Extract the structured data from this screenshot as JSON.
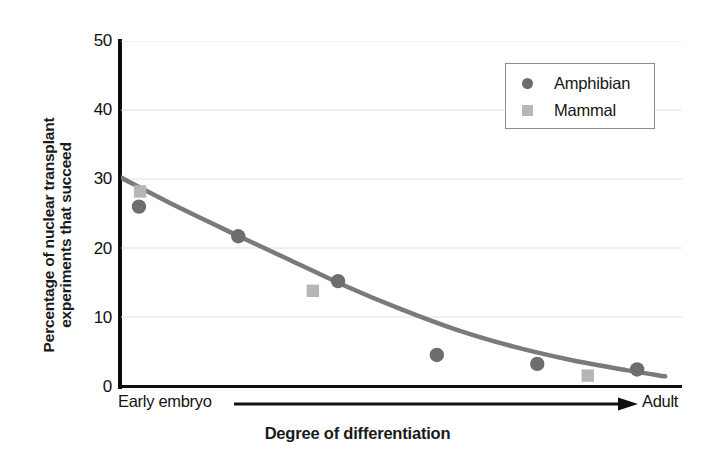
{
  "chart_data": {
    "type": "scatter",
    "title": "",
    "xlabel": "Degree of differentiation",
    "ylabel": "Percentage of nuclear transplant experiments that succeed",
    "ylabel_lines": [
      "Percentage of nuclear transplant",
      "experiments that succeed"
    ],
    "ylim": [
      0,
      50
    ],
    "yticks": [
      0,
      10,
      20,
      30,
      40,
      50
    ],
    "ytick_labels": [
      "0",
      "10",
      "20",
      "30",
      "40",
      "50"
    ],
    "xlim": [
      0,
      100
    ],
    "xticks": [],
    "xtick_labels": [],
    "x_axis_start_label": "Early embryo",
    "x_axis_end_label": "Adult",
    "x_axis_arrow": true,
    "grid": true,
    "grid_axis": "y",
    "grid_color": "#e2e2e2",
    "legend_position": "upper right",
    "series": [
      {
        "name": "Amphibian",
        "marker": "circle",
        "color": "#6d6d6d",
        "points": [
          {
            "x": 3.2,
            "y": 26.0
          },
          {
            "x": 20.9,
            "y": 21.7
          },
          {
            "x": 38.7,
            "y": 15.2
          },
          {
            "x": 56.3,
            "y": 4.5
          },
          {
            "x": 74.2,
            "y": 3.2
          },
          {
            "x": 92.0,
            "y": 2.4
          }
        ]
      },
      {
        "name": "Mammal",
        "marker": "square",
        "color": "#b6b6b6",
        "points": [
          {
            "x": 3.4,
            "y": 28.2
          },
          {
            "x": 34.2,
            "y": 13.8
          },
          {
            "x": 83.2,
            "y": 1.5
          }
        ]
      }
    ],
    "trend_line": {
      "name": "fitted decay curve",
      "color": "#7a7a7a",
      "width": 4.5,
      "points": [
        {
          "x": 0.0,
          "y": 30.2
        },
        {
          "x": 10.0,
          "y": 26.0
        },
        {
          "x": 20.0,
          "y": 22.1
        },
        {
          "x": 30.0,
          "y": 18.3
        },
        {
          "x": 40.0,
          "y": 14.5
        },
        {
          "x": 50.0,
          "y": 11.1
        },
        {
          "x": 60.0,
          "y": 8.1
        },
        {
          "x": 70.0,
          "y": 5.7
        },
        {
          "x": 80.0,
          "y": 3.8
        },
        {
          "x": 90.0,
          "y": 2.3
        },
        {
          "x": 97.0,
          "y": 1.4
        }
      ]
    }
  },
  "legend": {
    "entries": [
      {
        "label": "Amphibian",
        "marker": "circle",
        "color": "#6d6d6d"
      },
      {
        "label": "Mammal",
        "marker": "square",
        "color": "#b6b6b6"
      }
    ],
    "border_color": "#8d8d8d"
  },
  "axes": {
    "axis_color": "#0d0d0d",
    "y_tick_labels": [
      "50",
      "40",
      "30",
      "20",
      "10",
      "0"
    ],
    "y_label_line1": "Percentage of nuclear transplant",
    "y_label_line2": "experiments that succeed",
    "x_title": "Degree of differentiation",
    "x_start": "Early embryo",
    "x_end": "Adult"
  }
}
